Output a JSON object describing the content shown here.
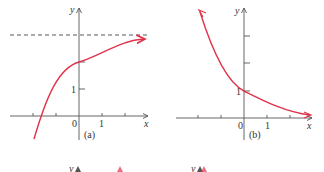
{
  "colors": {
    "curve": "#e0334a",
    "axis": "#555555",
    "dash": "#444444",
    "text": "#333333"
  },
  "panels": [
    {
      "id": "a",
      "caption": "(a)",
      "x_label": "x",
      "y_label": "y",
      "origin_label": "0",
      "x_tick_label": "1",
      "y_tick_label": "1",
      "asymptote": "dashed horizontal line y=3",
      "curve": "increasing exponential approaching horizontal asymptote"
    },
    {
      "id": "b",
      "caption": "(b)",
      "x_label": "x",
      "y_label": "y",
      "origin_label": "0",
      "x_tick_label": "1",
      "y_tick_label": "1",
      "curve": "decreasing exponential through (0,1) approaching x-axis"
    }
  ],
  "partial_row": {
    "y_label_1": "y",
    "y_label_2": "y"
  }
}
